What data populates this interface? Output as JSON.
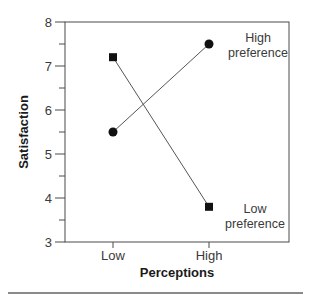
{
  "chart_data": {
    "type": "line",
    "title": "",
    "xlabel": "Perceptions",
    "ylabel": "Satisfaction",
    "categories": [
      "Low",
      "High"
    ],
    "ylim": [
      3,
      8
    ],
    "yticks": [
      "3",
      "4",
      "5",
      "6",
      "7",
      "8"
    ],
    "grid": false,
    "legend_position": "inline-right",
    "series": [
      {
        "name": "High preference",
        "label_line1": "High",
        "label_line2": "preference",
        "marker": "circle",
        "values": [
          5.5,
          7.5
        ]
      },
      {
        "name": "Low preference",
        "label_line1": "Low",
        "label_line2": "preference",
        "marker": "square",
        "values": [
          7.2,
          3.8
        ]
      }
    ]
  },
  "colors": {
    "axis": "#4a4a4a",
    "marker": "#111111",
    "line": "#555555",
    "separator": "#8a8a8a"
  }
}
